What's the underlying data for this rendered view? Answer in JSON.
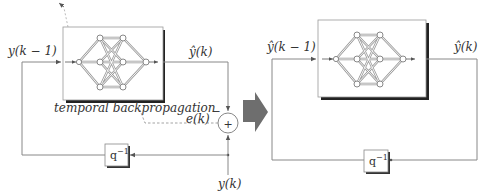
{
  "diagram": {
    "title": "",
    "left_system": {
      "input_label": "y(k − 1)",
      "output_label": "ŷ(k)",
      "training_label": "temporal backpropagation",
      "error_label": "e(k)",
      "sum_symbol": "+",
      "minus_sign": "−",
      "target_label": "y(k)",
      "delay_label": "q",
      "delay_exp": "−1"
    },
    "right_system": {
      "input_label": "ŷ(k − 1)",
      "output_label": "ŷ(k)",
      "delay_label": "q",
      "delay_exp": "−1"
    },
    "transition_arrow": "block-arrow-right",
    "colors": {
      "line": "#888888",
      "arrow_fill": "#6e6e6e",
      "box_shadow": "#222222",
      "text": "#333333"
    }
  }
}
